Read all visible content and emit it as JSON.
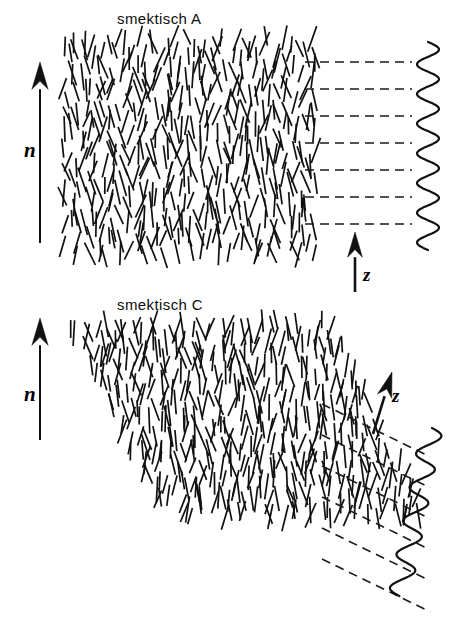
{
  "figure": {
    "width": 467,
    "height": 626,
    "background": "#ffffff",
    "stroke_color": "#111111",
    "dash_color": "#1a1a1a"
  },
  "panels": [
    {
      "id": "smectic-a",
      "title": "smektisch A",
      "title_x": 117,
      "title_y": 10,
      "director_label": "n",
      "director_arrow": {
        "x1": 40,
        "y1": 243,
        "x2": 40,
        "y2": 62,
        "head": 13,
        "width": 2.0,
        "tilt_deg": 0
      },
      "layer_normal_label": "z",
      "layer_normal_arrow": {
        "x1": 355,
        "y1": 292,
        "x2": 355,
        "y2": 232,
        "head": 12,
        "width": 2.6,
        "tilt_deg": 0
      },
      "rod_block": {
        "x": 68,
        "y": 42,
        "width": 242,
        "height": 212,
        "shear_deg": 0,
        "rod_length": 22,
        "rod_tilt_mean_deg": 0,
        "rod_tilt_spread_deg": 26,
        "columns": 26,
        "rows": 9,
        "jitter_x": 6,
        "jitter_y": 7,
        "stroke_width": 1.7,
        "seed": 17
      },
      "dashed_lines": {
        "count": 7,
        "x_start": 305,
        "x_end": 412,
        "y_first": 62,
        "y_spacing": 27,
        "slope_deg": 0,
        "dash_pattern": "9 6",
        "stroke_width": 1.6
      },
      "wave": {
        "x_center": 428,
        "y_top": 42,
        "y_bottom": 250,
        "amplitude": 11,
        "periods": 7,
        "tilt_deg": 0,
        "stroke_width": 2.2
      }
    },
    {
      "id": "smectic-c",
      "title": "smektisch C",
      "title_x": 117,
      "title_y": 296,
      "director_label": "n",
      "director_arrow": {
        "x1": 40,
        "y1": 440,
        "x2": 40,
        "y2": 318,
        "head": 13,
        "width": 2.0,
        "tilt_deg": 0
      },
      "layer_normal_label": "z",
      "layer_normal_arrow": {
        "x1": 373,
        "y1": 434,
        "x2": 392,
        "y2": 372,
        "head": 12,
        "width": 2.6,
        "tilt_deg": 20
      },
      "rod_block": {
        "x": 72,
        "y": 326,
        "width": 258,
        "height": 190,
        "shear_deg": 26,
        "rod_length": 22,
        "rod_tilt_mean_deg": 0,
        "rod_tilt_spread_deg": 24,
        "columns": 27,
        "rows": 9,
        "jitter_x": 6,
        "jitter_y": 7,
        "stroke_width": 1.7,
        "seed": 93
      },
      "dashed_lines": {
        "count": 6,
        "x_start": 322,
        "x_end": 430,
        "y_first": 404,
        "y_spacing": 31,
        "slope_deg": 26,
        "dash_pattern": "9 6",
        "stroke_width": 1.6
      },
      "wave": {
        "x_center": 432,
        "y_top": 428,
        "y_bottom": 596,
        "amplitude": 11,
        "periods": 5,
        "tilt_deg": -11,
        "stroke_width": 2.2
      }
    }
  ]
}
